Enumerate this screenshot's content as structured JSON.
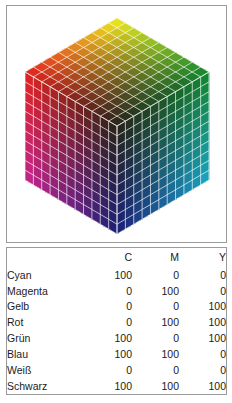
{
  "figure": {
    "type": "cmy-color-cube-with-table",
    "cube": {
      "projection": "isometric",
      "grid_divisions": 11,
      "gridline_color": "#ffffff",
      "corners": {
        "top_apex": {
          "label": "Gelb",
          "color": "#f2ee1e"
        },
        "left": {
          "label": "Rot",
          "color": "#e8231f"
        },
        "right": {
          "label": "Grün",
          "color": "#12892f"
        },
        "bottom_apex": {
          "label": "Blau",
          "color": "#1b2079"
        },
        "center_front": {
          "label": "Schwarz",
          "color": "#151515"
        },
        "hidden_back": {
          "label": "Weiß",
          "color": "#ffffff"
        },
        "lower_left": {
          "label": "Magenta",
          "color": "#c8248c"
        },
        "lower_right": {
          "label": "Cyan",
          "color": "#1aa7c4"
        }
      }
    }
  },
  "table": {
    "columns": [
      "",
      "C",
      "M",
      "Y"
    ],
    "rows": [
      {
        "name": "Cyan",
        "c": "100",
        "m": "0",
        "y": "0"
      },
      {
        "name": "Magenta",
        "c": "0",
        "m": "100",
        "y": "0"
      },
      {
        "name": "Gelb",
        "c": "0",
        "m": "0",
        "y": "100"
      },
      {
        "name": "Rot",
        "c": "0",
        "m": "100",
        "y": "100"
      },
      {
        "name": "Grün",
        "c": "100",
        "m": "0",
        "y": "100"
      },
      {
        "name": "Blau",
        "c": "100",
        "m": "100",
        "y": "0"
      },
      {
        "name": "Weiß",
        "c": "0",
        "m": "0",
        "y": "0"
      },
      {
        "name": "Schwarz",
        "c": "100",
        "m": "100",
        "y": "100"
      }
    ]
  },
  "colors": {
    "panel_border": "#9a9a9a",
    "text": "#1b1b1b",
    "background": "#ffffff"
  }
}
